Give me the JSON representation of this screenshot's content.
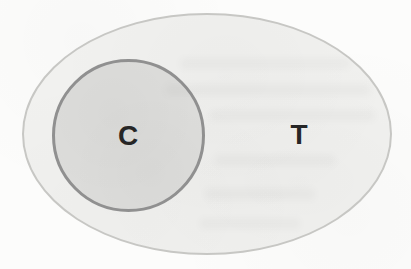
{
  "diagram": {
    "type": "euler-diagram",
    "outer_set": {
      "label": "T",
      "fill": "#f1f1ef",
      "border": "#c7c7c4"
    },
    "inner_set": {
      "label": "C",
      "fill": "#dcdcda",
      "border": "#909090"
    },
    "label_color": "#262626",
    "page_background": "#fcfcfb"
  }
}
